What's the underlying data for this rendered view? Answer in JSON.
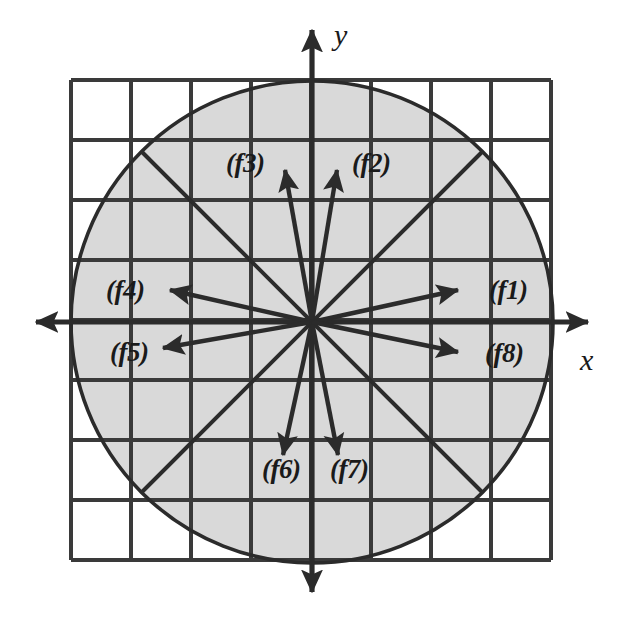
{
  "figure": {
    "colors": {
      "stroke": "#2b2b2b",
      "grid": "#3a3a3a",
      "disk_fill": "#d9d9d9",
      "background": "#ffffff"
    },
    "axes": {
      "x_label": "x",
      "y_label": "y",
      "origin": {
        "x": 312,
        "y": 322
      }
    },
    "grid": {
      "columns": 8,
      "rows": 8,
      "cell_size": 60,
      "left": 71,
      "top": 80,
      "right": 551,
      "bottom": 560
    },
    "circle": {
      "center_x": 312,
      "center_y": 322,
      "radius": 241
    },
    "vectors": [
      {
        "id": "f1",
        "label": "(f1)",
        "angle_deg": 22.5,
        "tip_x": 458,
        "tip_y": 290,
        "label_x": 489,
        "label_y": 277
      },
      {
        "id": "f2",
        "label": "(f2)",
        "angle_deg": 67.5,
        "tip_x": 337,
        "tip_y": 170,
        "label_x": 352,
        "label_y": 150
      },
      {
        "id": "f3",
        "label": "(f3)",
        "angle_deg": 112.5,
        "tip_x": 285,
        "tip_y": 170,
        "label_x": 226,
        "label_y": 150
      },
      {
        "id": "f4",
        "label": "(f4)",
        "angle_deg": 157.5,
        "tip_x": 170,
        "tip_y": 290,
        "label_x": 106,
        "label_y": 277
      },
      {
        "id": "f5",
        "label": "(f5)",
        "angle_deg": 202.5,
        "tip_x": 163,
        "tip_y": 348,
        "label_x": 110,
        "label_y": 339
      },
      {
        "id": "f6",
        "label": "(f6)",
        "angle_deg": 247.5,
        "tip_x": 283,
        "tip_y": 455,
        "label_x": 262,
        "label_y": 456
      },
      {
        "id": "f7",
        "label": "(f7)",
        "angle_deg": 292.5,
        "tip_x": 338,
        "tip_y": 455,
        "label_x": 330,
        "label_y": 456
      },
      {
        "id": "f8",
        "label": "(f8)",
        "angle_deg": 337.5,
        "tip_x": 458,
        "tip_y": 352,
        "label_x": 485,
        "label_y": 340
      }
    ],
    "diagonals": [
      {
        "id": "diagonal-nw-se",
        "x1": 141,
        "y1": 151,
        "x2": 483,
        "y2": 493
      },
      {
        "id": "diagonal-ne-sw",
        "x1": 483,
        "y1": 151,
        "x2": 141,
        "y2": 493
      }
    ]
  }
}
